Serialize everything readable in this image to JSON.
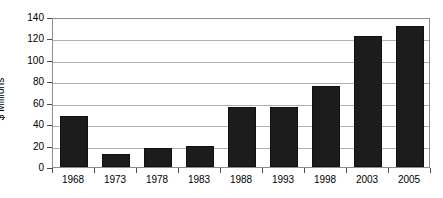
{
  "chart_data": {
    "type": "bar",
    "title": "",
    "subtitle": "",
    "xlabel": "",
    "ylabel": "$ Millions",
    "categories": [
      "1968",
      "1973",
      "1978",
      "1983",
      "1988",
      "1993",
      "1998",
      "2003",
      "2005"
    ],
    "values": [
      48,
      12,
      18,
      20,
      56,
      56,
      76,
      122,
      132
    ],
    "series": [
      {
        "name": "",
        "values": [
          48,
          12,
          18,
          20,
          56,
          56,
          76,
          122,
          132
        ]
      }
    ],
    "ylim": [
      0,
      140
    ],
    "yticks": [
      0,
      20,
      40,
      60,
      80,
      100,
      120,
      140
    ],
    "ytick_labels": [
      "0",
      "20",
      "40",
      "60",
      "80",
      "100",
      "120",
      "140"
    ],
    "grid": true,
    "grid_axis": "y",
    "legend": false,
    "legend_position": "none",
    "bar_color": "#1c1c1c",
    "gridline_color": "#b0b0b0",
    "axis_color": "#8d8d8d",
    "background_color": "#ffffff",
    "text_color": "#000000"
  }
}
